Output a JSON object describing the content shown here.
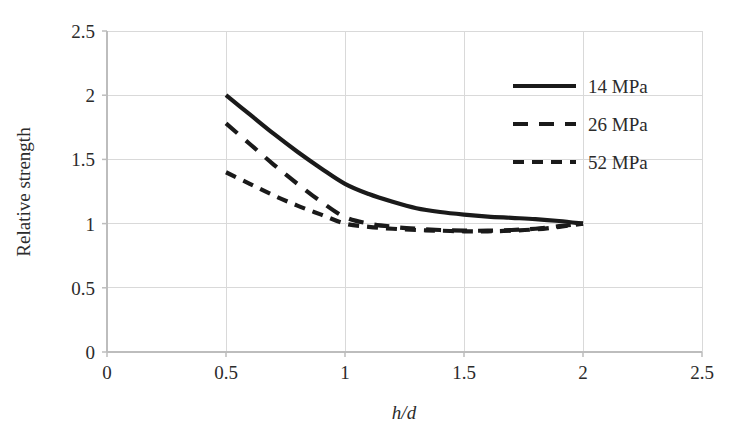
{
  "chart_data": {
    "type": "line",
    "title": "",
    "xlabel": "h/d",
    "ylabel": "Relative strength",
    "xlim": [
      0,
      2.5
    ],
    "ylim": [
      0,
      2.5
    ],
    "xticks": [
      "0",
      "0.5",
      "1",
      "1.5",
      "2",
      "2.5"
    ],
    "xtick_values": [
      0,
      0.5,
      1,
      1.5,
      2,
      2.5
    ],
    "yticks": [
      "0",
      "0.5",
      "1",
      "1.5",
      "2",
      "2.5"
    ],
    "ytick_values": [
      0,
      0.5,
      1,
      1.5,
      2,
      2.5
    ],
    "grid": true,
    "legend_position": "top-right",
    "series": [
      {
        "name": "14 MPa",
        "style": "solid",
        "color": "#1a1a1a",
        "x": [
          0.5,
          0.6,
          0.7,
          0.8,
          0.9,
          1.0,
          1.1,
          1.2,
          1.3,
          1.4,
          1.5,
          1.6,
          1.7,
          1.8,
          1.9,
          2.0
        ],
        "y": [
          2.0,
          1.85,
          1.7,
          1.56,
          1.43,
          1.31,
          1.23,
          1.17,
          1.12,
          1.09,
          1.07,
          1.055,
          1.045,
          1.035,
          1.02,
          1.0
        ]
      },
      {
        "name": "26 MPa",
        "style": "dashed-long",
        "color": "#1a1a1a",
        "x": [
          0.5,
          0.6,
          0.7,
          0.8,
          0.9,
          1.0,
          1.1,
          1.2,
          1.3,
          1.4,
          1.5,
          1.6,
          1.7,
          1.8,
          1.9,
          2.0
        ],
        "y": [
          1.78,
          1.62,
          1.46,
          1.31,
          1.17,
          1.05,
          1.0,
          0.975,
          0.96,
          0.95,
          0.945,
          0.945,
          0.95,
          0.96,
          0.98,
          1.0
        ]
      },
      {
        "name": "52 MPa",
        "style": "dashed-short",
        "color": "#1a1a1a",
        "x": [
          0.5,
          0.6,
          0.7,
          0.8,
          0.9,
          1.0,
          1.1,
          1.2,
          1.3,
          1.4,
          1.5,
          1.6,
          1.7,
          1.8,
          1.9,
          2.0
        ],
        "y": [
          1.4,
          1.31,
          1.22,
          1.14,
          1.07,
          1.0,
          0.975,
          0.96,
          0.95,
          0.945,
          0.94,
          0.94,
          0.945,
          0.955,
          0.975,
          1.0
        ]
      }
    ]
  },
  "legend": {
    "entries": [
      {
        "label": "14 MPa",
        "style": "solid"
      },
      {
        "label": "26 MPa",
        "style": "dashed-long"
      },
      {
        "label": "52 MPa",
        "style": "dashed-short"
      }
    ]
  },
  "axes": {
    "y_title": "Relative strength",
    "x_title": "h/d"
  }
}
